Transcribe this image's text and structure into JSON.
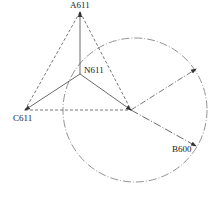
{
  "diagram": {
    "type": "phasor-diagram",
    "colors": {
      "line": "#444444",
      "circle": "#777777",
      "text": "#222222",
      "background": "#ffffff"
    },
    "points": {
      "A611": {
        "label": "A611",
        "x": 80,
        "y": 12
      },
      "N611": {
        "label": "N611",
        "x": 80,
        "y": 74
      },
      "C611": {
        "label": "C611",
        "x": 25,
        "y": 110
      },
      "B600": {
        "label": "B600",
        "x": 196,
        "y": 146
      },
      "O": {
        "x": 131,
        "y": 110
      },
      "R": {
        "x": 196,
        "y": 69
      }
    },
    "circle": {
      "cx": 135,
      "cy": 110,
      "r": 72,
      "style": "dash-dot"
    },
    "labels": {
      "a": "A611",
      "n": "N611",
      "c": "C611",
      "b": "B600"
    }
  }
}
